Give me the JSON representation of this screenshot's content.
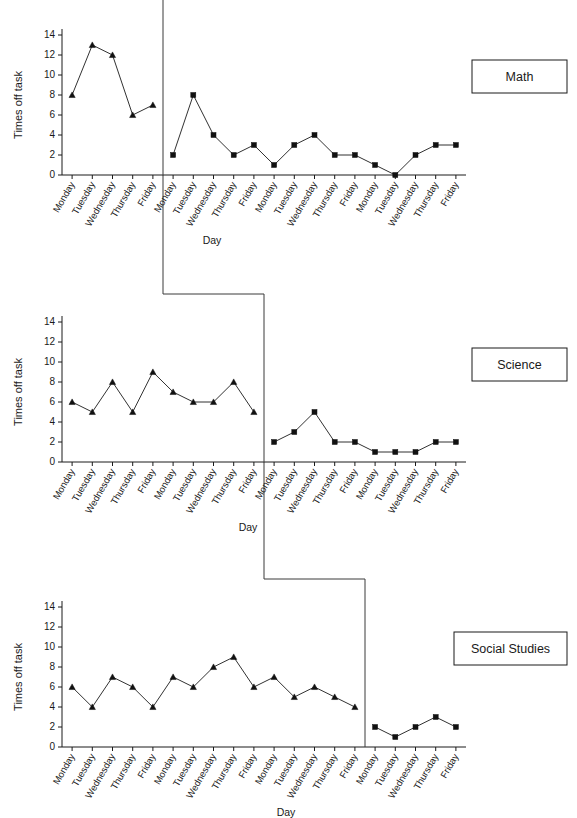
{
  "figure": {
    "title": "",
    "width": 577,
    "height": 818,
    "background_color": "#ffffff",
    "line_color": "#1a1a1a",
    "marker_color": "#111111",
    "phase_line_color": "#3a3a3a"
  },
  "axis": {
    "y_label": "Times off task",
    "x_label": "Day",
    "y_ticks": [
      "0",
      "2",
      "4",
      "6",
      "8",
      "10",
      "12",
      "14"
    ],
    "y_tick_values": [
      0,
      2,
      4,
      6,
      8,
      10,
      12,
      14
    ],
    "y_min": 0,
    "y_max": 15,
    "grid": "off"
  },
  "panels": [
    {
      "label": "Math",
      "label_name": "panel-label-math",
      "baseline_days": [
        "Monday",
        "Tuesday",
        "Wednesday",
        "Thursday",
        "Friday"
      ],
      "treatment_days": [
        "Monday",
        "Tuesday",
        "Wednesday",
        "Thursday",
        "Friday",
        "Monday",
        "Tuesday",
        "Wednesday",
        "Thursday",
        "Friday",
        "Monday",
        "Tuesday",
        "Wednesday",
        "Thursday",
        "Friday"
      ]
    },
    {
      "label": "Science",
      "label_name": "panel-label-science",
      "baseline_days": [
        "Monday",
        "Tuesday",
        "Wednesday",
        "Thursday",
        "Friday",
        "Monday",
        "Tuesday",
        "Wednesday",
        "Thursday",
        "Friday"
      ],
      "treatment_days": [
        "Monday",
        "Tuesday",
        "Wednesday",
        "Thursday",
        "Friday",
        "Monday",
        "Tuesday",
        "Wednesday",
        "Thursday",
        "Friday"
      ]
    },
    {
      "label": "Social Studies",
      "label_name": "panel-label-social-studies",
      "baseline_days": [
        "Monday",
        "Tuesday",
        "Wednesday",
        "Thursday",
        "Friday",
        "Monday",
        "Tuesday",
        "Wednesday",
        "Thursday",
        "Friday",
        "Monday",
        "Tuesday",
        "Wednesday",
        "Thursday",
        "Friday"
      ],
      "treatment_days": [
        "Monday",
        "Tuesday",
        "Wednesday",
        "Thursday",
        "Friday"
      ]
    }
  ],
  "chart_data": [
    {
      "type": "line",
      "title": "Math",
      "xlabel": "Day",
      "ylabel": "Times off task",
      "ylim": [
        0,
        15
      ],
      "yticks": [
        0,
        2,
        4,
        6,
        8,
        10,
        12,
        14
      ],
      "grid": false,
      "legend": "none",
      "annotations": [
        "Math"
      ],
      "phase_change_after_index": 4,
      "categories": [
        "Monday",
        "Tuesday",
        "Wednesday",
        "Thursday",
        "Friday",
        "Monday",
        "Tuesday",
        "Wednesday",
        "Thursday",
        "Friday",
        "Monday",
        "Tuesday",
        "Wednesday",
        "Thursday",
        "Friday",
        "Monday",
        "Tuesday",
        "Wednesday",
        "Thursday",
        "Friday"
      ],
      "series": [
        {
          "name": "Baseline",
          "marker": "triangle",
          "x_index": [
            0,
            1,
            2,
            3,
            4
          ],
          "values": [
            8,
            13,
            12,
            6,
            7
          ]
        },
        {
          "name": "Treatment",
          "marker": "square",
          "x_index": [
            5,
            6,
            7,
            8,
            9,
            10,
            11,
            12,
            13,
            14,
            15,
            16,
            17,
            18,
            19
          ],
          "values": [
            2,
            8,
            4,
            2,
            3,
            1,
            3,
            4,
            2,
            2,
            1,
            0,
            2,
            3,
            3
          ]
        }
      ]
    },
    {
      "type": "line",
      "title": "Science",
      "xlabel": "Day",
      "ylabel": "Times off task",
      "ylim": [
        0,
        15
      ],
      "yticks": [
        0,
        2,
        4,
        6,
        8,
        10,
        12,
        14
      ],
      "grid": false,
      "legend": "none",
      "annotations": [
        "Science"
      ],
      "phase_change_after_index": 9,
      "categories": [
        "Monday",
        "Tuesday",
        "Wednesday",
        "Thursday",
        "Friday",
        "Monday",
        "Tuesday",
        "Wednesday",
        "Thursday",
        "Friday",
        "Monday",
        "Tuesday",
        "Wednesday",
        "Thursday",
        "Friday",
        "Monday",
        "Tuesday",
        "Wednesday",
        "Thursday",
        "Friday"
      ],
      "series": [
        {
          "name": "Baseline",
          "marker": "triangle",
          "x_index": [
            0,
            1,
            2,
            3,
            4,
            5,
            6,
            7,
            8,
            9
          ],
          "values": [
            6,
            5,
            8,
            5,
            9,
            7,
            6,
            6,
            8,
            5
          ]
        },
        {
          "name": "Treatment",
          "marker": "square",
          "x_index": [
            10,
            11,
            12,
            13,
            14,
            15,
            16,
            17,
            18,
            19
          ],
          "values": [
            2,
            3,
            5,
            2,
            2,
            1,
            1,
            1,
            2,
            2
          ]
        }
      ]
    },
    {
      "type": "line",
      "title": "Social Studies",
      "xlabel": "Day",
      "ylabel": "Times off task",
      "ylim": [
        0,
        15
      ],
      "yticks": [
        0,
        2,
        4,
        6,
        8,
        10,
        12,
        14
      ],
      "grid": false,
      "legend": "none",
      "annotations": [
        "Social Studies"
      ],
      "phase_change_after_index": 14,
      "categories": [
        "Monday",
        "Tuesday",
        "Wednesday",
        "Thursday",
        "Friday",
        "Monday",
        "Tuesday",
        "Wednesday",
        "Thursday",
        "Friday",
        "Monday",
        "Tuesday",
        "Wednesday",
        "Thursday",
        "Friday",
        "Monday",
        "Tuesday",
        "Wednesday",
        "Thursday",
        "Friday"
      ],
      "series": [
        {
          "name": "Baseline",
          "marker": "triangle",
          "x_index": [
            0,
            1,
            2,
            3,
            4,
            5,
            6,
            7,
            8,
            9,
            10,
            11,
            12,
            13,
            14
          ],
          "values": [
            6,
            4,
            7,
            6,
            4,
            7,
            6,
            8,
            9,
            6,
            7,
            5,
            6,
            5,
            4
          ]
        },
        {
          "name": "Treatment",
          "marker": "square",
          "x_index": [
            15,
            16,
            17,
            18,
            19
          ],
          "values": [
            2,
            1,
            2,
            3,
            2
          ]
        }
      ]
    }
  ]
}
